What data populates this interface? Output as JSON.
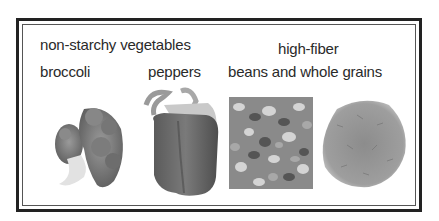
{
  "panel": {
    "left_group": {
      "heading": "non-starchy vegetables",
      "items": [
        {
          "label": "broccoli",
          "image": "broccoli-image"
        },
        {
          "label": "peppers",
          "image": "bell-pepper-image"
        }
      ]
    },
    "right_group": {
      "heading_line1": "high-fiber",
      "heading_line2": "beans and whole grains",
      "items": [
        {
          "image": "mixed-beans-image"
        },
        {
          "image": "whole-grains-image"
        }
      ]
    }
  },
  "colors": {
    "frame": "#222222",
    "text": "#2a2a2a",
    "background": "#ffffff"
  }
}
